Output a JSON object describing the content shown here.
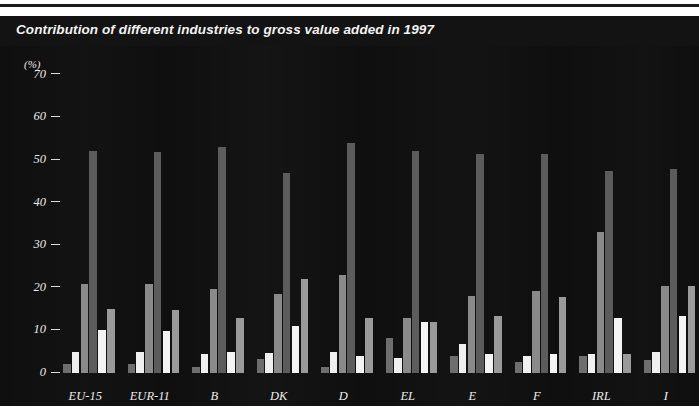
{
  "page": {
    "title_bar_label": "Contribution of different industries to gross value added  in 1997"
  },
  "chart_data": {
    "type": "bar",
    "title": "Contribution of different industries to gross value added  in 1997",
    "xlabel": "",
    "ylabel": "(%)",
    "unit_label": "(%)",
    "ylim": [
      0,
      72
    ],
    "yticks": [
      0,
      10,
      20,
      30,
      40,
      50,
      60,
      70
    ],
    "ytick_labels": [
      "0",
      "10",
      "20",
      "30",
      "40",
      "50",
      "60",
      "70"
    ],
    "grid": false,
    "legend_position": "none",
    "categories": [
      "EU-15",
      "EUR-11",
      "B",
      "DK",
      "D",
      "EL",
      "E",
      "F",
      "IRL",
      "I"
    ],
    "series": [
      {
        "name": "Agriculture",
        "color": "#6e6e6e",
        "values": [
          2.0,
          2.2,
          1.5,
          3.2,
          1.3,
          8.2,
          4.0,
          2.5,
          4.0,
          3.0
        ]
      },
      {
        "name": "Energy",
        "color": "#f0f0f0",
        "values": [
          5.0,
          5.0,
          4.5,
          4.8,
          5.0,
          3.5,
          6.8,
          4.0,
          4.5,
          5.0
        ]
      },
      {
        "name": "Manufacturing",
        "color": "#8a8a8a",
        "values": [
          20.8,
          21.0,
          19.8,
          18.5,
          23.0,
          13.0,
          18.0,
          19.2,
          33.0,
          20.5
        ]
      },
      {
        "name": "Services",
        "color": "#5c5c5c",
        "values": [
          52.0,
          51.8,
          53.0,
          47.0,
          54.0,
          52.0,
          51.5,
          51.5,
          47.5,
          48.0
        ]
      },
      {
        "name": "Construction",
        "color": "#f4f4f4",
        "values": [
          10.0,
          9.8,
          5.0,
          11.0,
          4.0,
          12.0,
          4.5,
          4.5,
          13.0,
          13.5
        ]
      },
      {
        "name": "Trade and transport",
        "color": "#9a9a9a",
        "values": [
          15.0,
          14.8,
          13.0,
          22.0,
          13.0,
          12.0,
          13.5,
          17.8,
          4.5,
          20.5
        ]
      }
    ]
  },
  "colors": {
    "panel_background": "#100f10",
    "title_background": "#141314",
    "page_background": "#ffffff",
    "axis_text": "#eaeaea"
  }
}
